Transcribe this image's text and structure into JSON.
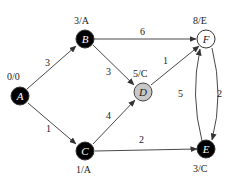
{
  "nodes": {
    "A": {
      "name": "A",
      "label": "0/0",
      "fill": "#000000",
      "text_color": "#ffffff"
    },
    "B": {
      "name": "B",
      "label": "3/A",
      "fill": "#000000",
      "text_color": "#ffffff"
    },
    "C": {
      "name": "C",
      "label": "1/A",
      "fill": "#000000",
      "text_color": "#ffffff"
    },
    "D": {
      "name": "D",
      "label": "5/C",
      "fill": "#c8c8c8",
      "text_color": "#222222"
    },
    "E": {
      "name": "E",
      "label": "3/C",
      "fill": "#000000",
      "text_color": "#ffffff"
    },
    "F": {
      "name": "F",
      "label": "8/E",
      "fill": "#ffffff",
      "text_color": "#222222"
    }
  },
  "edges": {
    "AB": {
      "from": "A",
      "to": "B",
      "weight": "3"
    },
    "AC": {
      "from": "A",
      "to": "C",
      "weight": "1"
    },
    "BF": {
      "from": "B",
      "to": "F",
      "weight": "6"
    },
    "BD": {
      "from": "B",
      "to": "D",
      "weight": "3"
    },
    "CD": {
      "from": "C",
      "to": "D",
      "weight": "4"
    },
    "CE": {
      "from": "C",
      "to": "E",
      "weight": "2"
    },
    "DF": {
      "from": "D",
      "to": "F",
      "weight": "1"
    },
    "EF": {
      "from": "E",
      "to": "F",
      "weight": "5"
    },
    "FE": {
      "from": "F",
      "to": "E",
      "weight": "2"
    }
  }
}
